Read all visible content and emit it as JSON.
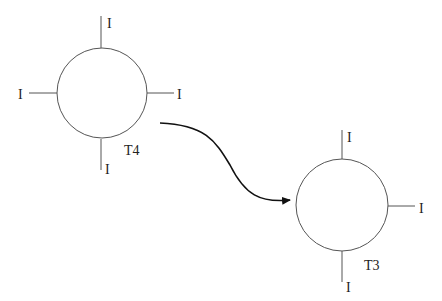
{
  "diagram": {
    "nodes": [
      {
        "id": "T4",
        "label": "T4",
        "terminals": [
          "I",
          "I",
          "I",
          "I"
        ]
      },
      {
        "id": "T3",
        "label": "T3",
        "terminals": [
          "I",
          "I",
          "I"
        ]
      }
    ],
    "edges": [
      {
        "from": "T4",
        "to": "T3",
        "style": "curved-arrow"
      }
    ],
    "colors": {
      "stroke": "#555555",
      "arrow": "#111111",
      "text": "#222222"
    }
  }
}
